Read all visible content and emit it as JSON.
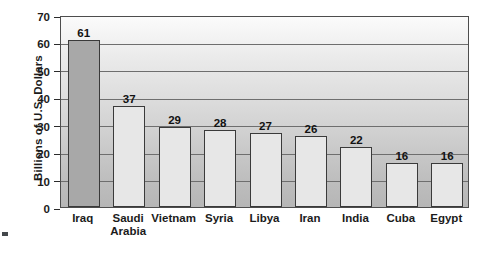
{
  "chart_data": {
    "type": "bar",
    "title": "",
    "xlabel": "",
    "ylabel": "Billions of U.S. Dollars",
    "ylim": [
      0,
      70
    ],
    "ytick_step": 10,
    "yticks": [
      0,
      10,
      20,
      30,
      40,
      50,
      60,
      70
    ],
    "grid": true,
    "legend": "none",
    "categories": [
      "Iraq",
      "Saudi Arabia",
      "Vietnam",
      "Syria",
      "Libya",
      "Iran",
      "India",
      "Cuba",
      "Egypt"
    ],
    "values": [
      61,
      37,
      29,
      28,
      27,
      26,
      22,
      16,
      16
    ],
    "bars": [
      {
        "category": "Iraq",
        "label_lines": "Iraq",
        "value": 61,
        "value_label": "61",
        "highlight": true
      },
      {
        "category": "Saudi Arabia",
        "label_lines": "Saudi\nArabia",
        "value": 37,
        "value_label": "37",
        "highlight": false
      },
      {
        "category": "Vietnam",
        "label_lines": "Vietnam",
        "value": 29,
        "value_label": "29",
        "highlight": false
      },
      {
        "category": "Syria",
        "label_lines": "Syria",
        "value": 28,
        "value_label": "28",
        "highlight": false
      },
      {
        "category": "Libya",
        "label_lines": "Libya",
        "value": 27,
        "value_label": "27",
        "highlight": false
      },
      {
        "category": "Iran",
        "label_lines": "Iran",
        "value": 26,
        "value_label": "26",
        "highlight": false
      },
      {
        "category": "India",
        "label_lines": "India",
        "value": 22,
        "value_label": "22",
        "highlight": false
      },
      {
        "category": "Cuba",
        "label_lines": "Cuba",
        "value": 16,
        "value_label": "16",
        "highlight": false
      },
      {
        "category": "Egypt",
        "label_lines": "Egypt",
        "value": 16,
        "value_label": "16",
        "highlight": false
      }
    ],
    "colors": {
      "bar_fill": "#e7e7e7",
      "bar_fill_highlight": "#a8a8a8",
      "bar_outline": "#3a3a3a",
      "gridline": "#6e6e6e",
      "text": "#1b1b1b",
      "plot_border": "#4d4d4d",
      "background_top": "#fbfbfb",
      "background_bottom": "#b6b6b6"
    }
  }
}
